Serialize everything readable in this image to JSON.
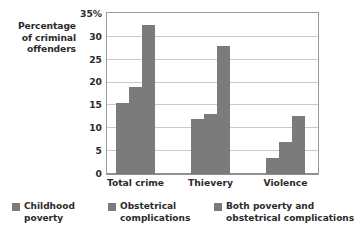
{
  "chart_data": {
    "type": "bar",
    "title": "",
    "subtitle": "",
    "xlabel": "",
    "ylabel": "Percentage of criminal offenders",
    "ylabel_lines": [
      "Percentage",
      "of criminal",
      "offenders"
    ],
    "categories": [
      "Total crime",
      "Thievery",
      "Violence"
    ],
    "series": [
      {
        "name": "Childhood poverty",
        "name_lines": [
          "Childhood",
          "poverty"
        ],
        "color": "#7b7b7b",
        "values": [
          15.5,
          12,
          3.5
        ]
      },
      {
        "name": "Obstetrical complications",
        "name_lines": [
          "Obstetrical",
          "complications"
        ],
        "color": "#7b7b7b",
        "values": [
          19,
          13,
          7
        ]
      },
      {
        "name": "Both poverty and obstetrical complications",
        "name_lines": [
          "Both poverty and",
          "obstetrical complications"
        ],
        "color": "#7b7b7b",
        "values": [
          32.5,
          28,
          12.5
        ]
      }
    ],
    "ylim": [
      0,
      35
    ],
    "yticks": [
      0,
      5,
      10,
      15,
      20,
      25,
      30,
      35
    ],
    "ytick_labels": [
      "0",
      "5",
      "10",
      "15",
      "20",
      "25",
      "30",
      "35%"
    ],
    "grid": true,
    "grid_color": "#c9c9c9",
    "legend_position": "bottom",
    "plot_background": "#ffffff",
    "frame_color": "#9a9a9a",
    "text_color": "#2b2b2b"
  }
}
